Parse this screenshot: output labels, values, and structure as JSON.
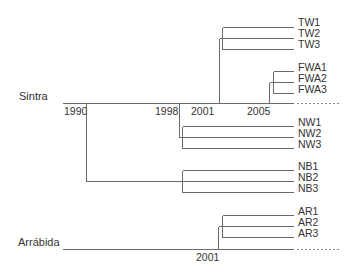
{
  "diagram": {
    "type": "phylogenetic-timeline-tree",
    "colors": {
      "line": "#6a6a6a",
      "text": "#333333",
      "background": "#ffffff"
    },
    "sites": [
      {
        "name": "Sintra"
      },
      {
        "name": "Arrábida"
      }
    ],
    "years": {
      "sintra": [
        "1990",
        "1998",
        "2001",
        "2005"
      ],
      "arrabida": [
        "2001"
      ]
    },
    "clades": {
      "TW": [
        "TW1",
        "TW2",
        "TW3"
      ],
      "FWA": [
        "FWA1",
        "FWA2",
        "FWA3"
      ],
      "NW": [
        "NW1",
        "NW2",
        "NW3"
      ],
      "NB": [
        "NB1",
        "NB2",
        "NB3"
      ],
      "AR": [
        "AR1",
        "AR2",
        "AR3"
      ]
    }
  }
}
